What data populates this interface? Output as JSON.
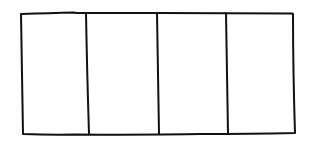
{
  "diagram": {
    "type": "hand-drawn rectangle divided into equal vertical sections",
    "section_count": 4,
    "stroke_color": "#111111",
    "background_color": "#ffffff",
    "sections": [
      {
        "index": 1,
        "label": ""
      },
      {
        "index": 2,
        "label": ""
      },
      {
        "index": 3,
        "label": ""
      },
      {
        "index": 4,
        "label": ""
      }
    ]
  }
}
